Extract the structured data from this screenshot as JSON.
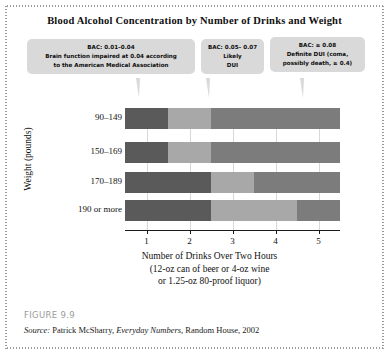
{
  "figure": {
    "number": "FIGURE 9.9",
    "source_label": "Source:",
    "source_author": "Patrick McSharry,",
    "source_title": "Everyday Numbers",
    "source_publisher": ", Random House, 2002"
  },
  "callouts": [
    {
      "id": "bac-low",
      "lines": [
        "BAC: 0.01–0.04",
        "Brain function impaired at 0.04 according",
        "to the American Medical Association"
      ]
    },
    {
      "id": "bac-mid",
      "lines": [
        "BAC: 0.05– 0.07",
        "Likely",
        "DUI"
      ]
    },
    {
      "id": "bac-high",
      "lines": [
        "BAC: ≥ 0.08",
        "Definite DUI (coma,",
        "possibly death, ≥ 0.4)"
      ]
    }
  ],
  "colors": {
    "light": "#a8a8a8",
    "medium": "#7c7c7c",
    "dark": "#5a5a5a",
    "callout_bg": "#d9d9d9",
    "axis": "#1a1a1a",
    "grid": "#d8d8d8"
  },
  "chart_data": {
    "type": "heatmap",
    "title": "Blood Alcohol Concentration by Number of Drinks and Weight",
    "xlabel": "Number of Drinks Over Two Hours",
    "xlabel_sub1": "(12-oz can of beer or 4-oz wine",
    "xlabel_sub2": "or 1.25-oz 80-proof liquor)",
    "ylabel": "Weight (pounds)",
    "xlim": [
      0.5,
      5.5
    ],
    "xticks": [
      1,
      2,
      3,
      4,
      5
    ],
    "xtick_labels": [
      "1",
      "2",
      "3",
      "4",
      "5"
    ],
    "categories": [
      "90–149",
      "150–169",
      "170–189",
      "190 or more"
    ],
    "grid": true,
    "legend_position": "top-callouts",
    "bac_levels": [
      {
        "name": "BAC: 0.01–0.04",
        "shade": "dark",
        "color": "#5a5a5a"
      },
      {
        "name": "BAC: 0.05–0.07",
        "shade": "light",
        "color": "#a8a8a8"
      },
      {
        "name": "BAC: ≥ 0.08",
        "shade": "medium",
        "color": "#7c7c7c"
      }
    ],
    "rows": [
      {
        "weight": "90–149",
        "segments": [
          {
            "level": "BAC: 0.01–0.04",
            "color": "#5a5a5a",
            "x_start": 0.5,
            "x_end": 1.5
          },
          {
            "level": "BAC: 0.05–0.07",
            "color": "#a8a8a8",
            "x_start": 1.5,
            "x_end": 2.5
          },
          {
            "level": "BAC: ≥ 0.08",
            "color": "#7c7c7c",
            "x_start": 2.5,
            "x_end": 5.5
          }
        ]
      },
      {
        "weight": "150–169",
        "segments": [
          {
            "level": "BAC: 0.01–0.04",
            "color": "#5a5a5a",
            "x_start": 0.5,
            "x_end": 1.5
          },
          {
            "level": "BAC: 0.05–0.07",
            "color": "#a8a8a8",
            "x_start": 1.5,
            "x_end": 2.5
          },
          {
            "level": "BAC: ≥ 0.08",
            "color": "#7c7c7c",
            "x_start": 2.5,
            "x_end": 5.5
          }
        ]
      },
      {
        "weight": "170–189",
        "segments": [
          {
            "level": "BAC: 0.01–0.04",
            "color": "#5a5a5a",
            "x_start": 0.5,
            "x_end": 2.5
          },
          {
            "level": "BAC: 0.05–0.07",
            "color": "#a8a8a8",
            "x_start": 2.5,
            "x_end": 3.5
          },
          {
            "level": "BAC: ≥ 0.08",
            "color": "#7c7c7c",
            "x_start": 3.5,
            "x_end": 5.5
          }
        ]
      },
      {
        "weight": "190 or more",
        "segments": [
          {
            "level": "BAC: 0.01–0.04",
            "color": "#5a5a5a",
            "x_start": 0.5,
            "x_end": 2.5
          },
          {
            "level": "BAC: 0.05–0.07",
            "color": "#a8a8a8",
            "x_start": 2.5,
            "x_end": 4.5
          },
          {
            "level": "BAC: ≥ 0.08",
            "color": "#7c7c7c",
            "x_start": 4.5,
            "x_end": 5.5
          }
        ]
      }
    ]
  }
}
